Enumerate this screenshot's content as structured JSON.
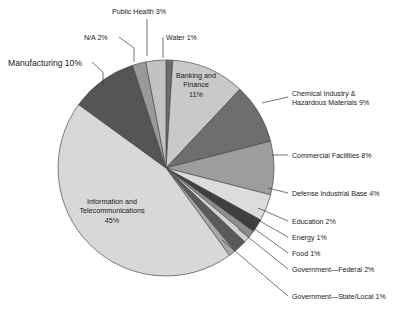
{
  "chart_data": {
    "type": "pie",
    "title": "",
    "legend_position": "callout-labels",
    "units": "percent",
    "total": 100,
    "categories": [
      "Water",
      "Banking and Finance",
      "Chemical Industry & Hazardous Materials",
      "Commercial Facilities",
      "Defense Industrial Base",
      "Education",
      "Energy",
      "Food",
      "Government—Federal",
      "Government—State/Local",
      "Information and Telecommunications",
      "Manufacturing",
      "N/A",
      "Public Health"
    ],
    "values": [
      1,
      11,
      9,
      8,
      4,
      2,
      1,
      1,
      2,
      1,
      45,
      10,
      2,
      3
    ],
    "slices": [
      {
        "label": "Water",
        "value": 1,
        "display": "Water 1%",
        "color": "#6b6b6b",
        "label_mode": "callout"
      },
      {
        "label": "Banking and Finance",
        "value": 11,
        "display": "Banking and Finance 11%",
        "color": "#c9c9c9",
        "label_mode": "inside",
        "lines": [
          "Banking and",
          "Finance",
          "11%"
        ]
      },
      {
        "label": "Chemical Industry & Hazardous Materials",
        "value": 9,
        "display": "Chemical Industry & Hazardous Materials 9%",
        "color": "#6e6e6e",
        "label_mode": "callout",
        "lines": [
          "Chemical Industry &",
          "Hazardous Materials 9%"
        ]
      },
      {
        "label": "Commercial Facilities",
        "value": 8,
        "display": "Commercial Facilities 8%",
        "color": "#9d9d9d",
        "label_mode": "callout"
      },
      {
        "label": "Defense Industrial Base",
        "value": 4,
        "display": "Defense Industrial Base 4%",
        "color": "#dcdcdc",
        "label_mode": "callout"
      },
      {
        "label": "Education",
        "value": 2,
        "display": "Education 2%",
        "color": "#3f3f3f",
        "label_mode": "callout"
      },
      {
        "label": "Energy",
        "value": 1,
        "display": "Energy 1%",
        "color": "#8f8f8f",
        "label_mode": "callout"
      },
      {
        "label": "Food",
        "value": 1,
        "display": "Food 1%",
        "color": "#d2d2d2",
        "label_mode": "callout"
      },
      {
        "label": "Government—Federal",
        "value": 2,
        "display": "Government—Federal 2%",
        "color": "#5a5a5a",
        "label_mode": "callout"
      },
      {
        "label": "Government—State/Local",
        "value": 1,
        "display": "Government—State/Local 1%",
        "color": "#a8a8a8",
        "label_mode": "callout"
      },
      {
        "label": "Information and Telecommunications",
        "value": 45,
        "display": "Information and Telecommunications 45%",
        "color": "#d8d8d8",
        "label_mode": "inside",
        "lines": [
          "Information and",
          "Telecommunications",
          "45%"
        ]
      },
      {
        "label": "Manufacturing",
        "value": 10,
        "display": "Manufacturing 10%",
        "color": "#555555",
        "label_mode": "callout"
      },
      {
        "label": "N/A",
        "value": 2,
        "display": "N/A 2%",
        "color": "#9a9a9a",
        "label_mode": "callout"
      },
      {
        "label": "Public Health",
        "value": 3,
        "display": "Public Health 3%",
        "color": "#c2c2c2",
        "label_mode": "callout"
      }
    ]
  },
  "geometry": {
    "center_x": 166,
    "center_y": 168,
    "radius": 108,
    "start_angle_deg": -90
  },
  "callouts": [
    {
      "key": "public-health",
      "text": "Public Health 3%",
      "x": 112,
      "y": 14,
      "anchor": "start",
      "path": "M 147 19 L 147 56"
    },
    {
      "key": "na",
      "text": "N/A 2%",
      "x": 84,
      "y": 40,
      "anchor": "start",
      "path": "M 119 37 L 134 48 L 134 62"
    },
    {
      "key": "water",
      "text": "Water 1%",
      "x": 166,
      "y": 40,
      "anchor": "start",
      "path": "M 163 37 L 163 58"
    },
    {
      "key": "manufacturing",
      "text": "Manufacturing 10%",
      "x": 8,
      "y": 66,
      "anchor": "start",
      "big": true,
      "path": "M 92 62 L 103 72 L 103 86"
    },
    {
      "key": "chemical",
      "text": "Chemical Industry & Hazardous Materials 9%",
      "x": 292,
      "y": 96,
      "anchor": "start",
      "path": "M 262 103 L 288 97"
    },
    {
      "key": "commercial",
      "text": "Commercial Facilities 8%",
      "x": 292,
      "y": 158,
      "anchor": "start",
      "path": "M 272 155 L 288 155"
    },
    {
      "key": "defense",
      "text": "Defense Industrial Base 4%",
      "x": 292,
      "y": 196,
      "anchor": "start",
      "path": "M 268 188 L 288 193"
    },
    {
      "key": "education",
      "text": "Education 2%",
      "x": 292,
      "y": 224,
      "anchor": "start",
      "path": "M 258 208 L 288 221"
    },
    {
      "key": "energy",
      "text": "Energy 1%",
      "x": 292,
      "y": 240,
      "anchor": "start",
      "path": "M 251 216 L 288 237"
    },
    {
      "key": "food",
      "text": "Food 1%",
      "x": 292,
      "y": 256,
      "anchor": "start",
      "path": "M 245 222 L 288 253"
    },
    {
      "key": "gov-federal",
      "text": "Government—Federal 2%",
      "x": 292,
      "y": 272,
      "anchor": "start",
      "path": "M 238 229 L 288 269"
    },
    {
      "key": "gov-state-local",
      "text": "Government—State/Local 1%",
      "x": 292,
      "y": 299,
      "anchor": "start",
      "path": "M 222 240 L 288 296"
    }
  ],
  "inner_labels": [
    {
      "key": "banking",
      "x": 196,
      "y": 78,
      "lines": [
        "Banking and",
        "Finance",
        "11%"
      ]
    },
    {
      "key": "infotelecom",
      "x": 112,
      "y": 204,
      "lines": [
        "Information and",
        "Telecommunications",
        "45%"
      ]
    }
  ]
}
